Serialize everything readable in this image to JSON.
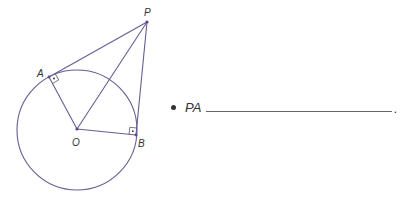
{
  "diagram": {
    "stroke_color": "#6b5b95",
    "circle": {
      "center": "O",
      "cx": 77,
      "cy": 130,
      "r": 60
    },
    "points": {
      "P": {
        "label": "P",
        "x": 147,
        "y": 22
      },
      "A": {
        "label": "A",
        "x": 49,
        "y": 77
      },
      "O": {
        "label": "O",
        "x": 77,
        "y": 129
      },
      "B": {
        "label": "B",
        "x": 136,
        "y": 135
      }
    },
    "segments": [
      "PA",
      "PB",
      "PO",
      "OA",
      "OB"
    ],
    "right_angles": [
      "A",
      "B"
    ]
  },
  "prompt": {
    "bullet": "•",
    "label": "PA",
    "blank": "",
    "terminator": "."
  }
}
